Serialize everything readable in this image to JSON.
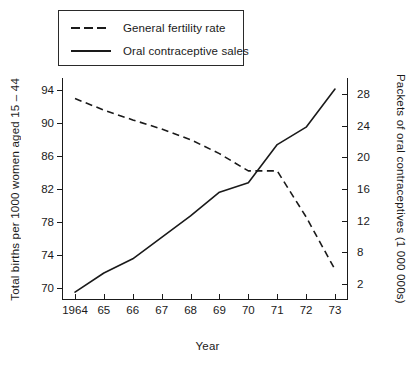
{
  "chart_data": {
    "type": "line",
    "title": "",
    "xlabel": "Year",
    "ylabel": "Total births per 1000 women aged 15 – 44",
    "y2label": "Packets of oral contraceptives (1 000 000s)",
    "x": [
      1964,
      1965,
      1966,
      1967,
      1968,
      1969,
      1970,
      1971,
      1972,
      1973
    ],
    "xtick_labels": [
      "1964",
      "65",
      "66",
      "67",
      "68",
      "69",
      "70",
      "71",
      "72",
      "73"
    ],
    "ytick_labels_left": [
      "94",
      "90",
      "86",
      "82",
      "78",
      "74",
      "70"
    ],
    "ytick_values_left": [
      94,
      90,
      86,
      82,
      78,
      74,
      70
    ],
    "ylim": [
      68.5,
      95.5
    ],
    "ytick_labels_right": [
      "28",
      "24",
      "20",
      "16",
      "12",
      "8",
      "2"
    ],
    "ytick_values_right": [
      28,
      24,
      20,
      16,
      12,
      8,
      4
    ],
    "y2lim": [
      2,
      30
    ],
    "grid": false,
    "legend_position": "top-left",
    "series": [
      {
        "name": "General fertility rate",
        "style": "dashed",
        "axis": "left",
        "values": [
          93.0,
          91.6,
          90.4,
          89.3,
          88.0,
          86.3,
          84.2,
          84.2,
          78.6,
          72.2
        ]
      },
      {
        "name": "Oral contraceptive sales",
        "style": "solid",
        "axis": "right",
        "values": [
          3.0,
          5.4,
          7.2,
          9.9,
          12.6,
          15.6,
          16.8,
          21.6,
          23.8,
          28.6
        ]
      }
    ]
  },
  "legend": {
    "items": [
      {
        "label": "General fertility rate",
        "style": "dashed"
      },
      {
        "label": "Oral contraceptive sales",
        "style": "solid"
      }
    ]
  }
}
